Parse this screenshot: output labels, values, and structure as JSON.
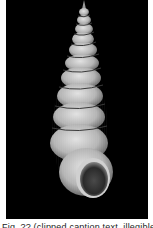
{
  "image": {
    "subject": "elongated high-spired gastropod shell, apertural view",
    "background_color": "#000000",
    "shell_color": "#c8c8c8",
    "whorl_count_visible": 11
  },
  "caption": {
    "text": "Fig. ?? (clipped caption text, illegible) ?? ?.?.?",
    "clipped": true
  }
}
